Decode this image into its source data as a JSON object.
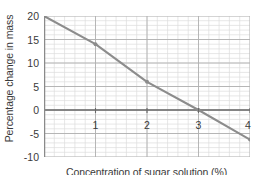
{
  "chart_data": {
    "type": "line",
    "title": "",
    "xlabel": "Concentration of sugar solution (%)",
    "ylabel": "Percentage change in mass",
    "x": [
      0,
      1,
      2,
      3,
      4
    ],
    "values": [
      20,
      14,
      6,
      0,
      -6.3
    ],
    "series": [
      {
        "name": "Percentage change in mass",
        "values": [
          20,
          14,
          6,
          0,
          -6.3
        ],
        "color": "#8c8c8c"
      }
    ],
    "xlim": [
      0,
      4
    ],
    "ylim": [
      -10,
      20
    ],
    "xticks": [
      0,
      1,
      2,
      3,
      4
    ],
    "xtick_labels": [
      "",
      "1",
      "2",
      "3",
      "4"
    ],
    "yticks": [
      20,
      15,
      10,
      5,
      0,
      -5,
      -10
    ],
    "ytick_labels": [
      "20",
      "15",
      "10",
      "5",
      "0",
      "-5",
      "-10"
    ],
    "x_minor_step": 0.2,
    "y_minor_step": 1,
    "grid": true,
    "legend": "none",
    "zero_line": 0,
    "markers": true,
    "colors": {
      "line": "#8c8c8c",
      "marker": "#8c8c8c",
      "major_grid": "#b0b0b0",
      "minor_grid": "#dcdcdc",
      "axis": "#8a8a8a",
      "zero_axis": "#6a6a6a",
      "text": "#3a3a3a",
      "background": "#ffffff"
    }
  },
  "axes": {
    "y_title": "Percentage change in mass",
    "x_title": "Concentration of sugar solution (%)",
    "y_labels": [
      "20",
      "15",
      "10",
      "5",
      "0",
      "-5",
      "-10"
    ],
    "x_labels": [
      "1",
      "2",
      "3",
      "4"
    ]
  }
}
